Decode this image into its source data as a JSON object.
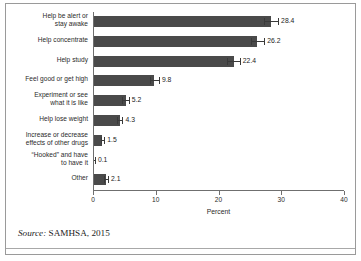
{
  "figure": {
    "source_prefix": "Source:",
    "source_text": " SAMHSA, 2015"
  },
  "chart_data": {
    "type": "bar",
    "orientation": "horizontal",
    "title": "",
    "xlabel": "Percent",
    "ylabel": "",
    "xlim": [
      0,
      40
    ],
    "xticks": [
      0,
      10,
      20,
      30,
      40
    ],
    "xtick_labels": [
      "0",
      "10",
      "20",
      "30",
      "40"
    ],
    "grid": false,
    "legend": false,
    "bar_color": "#4a4a4a",
    "axis_color": "#6f6f6f",
    "categories": [
      "Help be alert or\nstay awake",
      "Help concentrate",
      "Help study",
      "Feel good or get high",
      "Experiment or see\nwhat it is like",
      "Help lose weight",
      "Increase or decrease\neffects of other drugs",
      "“Hooked” and have\nto have it",
      "Other"
    ],
    "values": [
      28.4,
      26.2,
      22.4,
      9.8,
      5.2,
      4.3,
      1.5,
      0.1,
      2.1
    ],
    "value_labels": [
      "28.4",
      "26.2",
      "22.4",
      "9.8",
      "5.2",
      "4.3",
      "1.5",
      "0.1",
      "2.1"
    ],
    "error_low": [
      27.3,
      25.1,
      21.4,
      9.1,
      4.7,
      3.9,
      1.2,
      0.0,
      1.8
    ],
    "error_high": [
      29.5,
      27.3,
      23.4,
      10.5,
      5.7,
      4.7,
      1.8,
      0.3,
      2.4
    ]
  }
}
